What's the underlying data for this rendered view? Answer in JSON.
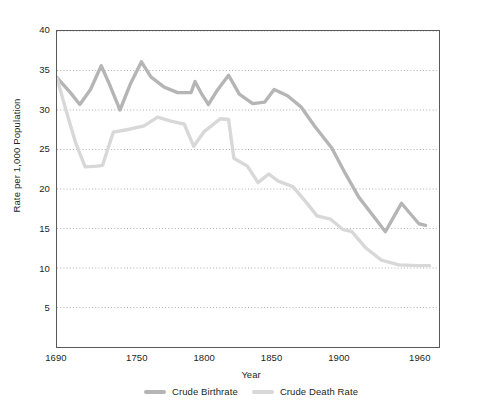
{
  "chart_data": {
    "type": "line",
    "title": "",
    "xlabel": "Year",
    "ylabel": "Rate per 1,000 Population",
    "xlim": [
      1690,
      1975
    ],
    "ylim": [
      0,
      40
    ],
    "yticks": [
      5,
      10,
      15,
      20,
      25,
      30,
      35,
      40
    ],
    "xticks": [
      1690,
      1750,
      1800,
      1850,
      1900,
      1960
    ],
    "grid": "horizontal-dotted",
    "legend_position": "bottom-center",
    "series": [
      {
        "name": "Crude Birthrate",
        "color": "#b5b5b5",
        "points": [
          [
            1690,
            34.1
          ],
          [
            1700,
            32.2
          ],
          [
            1707,
            30.7
          ],
          [
            1715,
            32.6
          ],
          [
            1723,
            35.6
          ],
          [
            1729,
            33.3
          ],
          [
            1737,
            30.0
          ],
          [
            1745,
            33.4
          ],
          [
            1753,
            36.1
          ],
          [
            1760,
            34.2
          ],
          [
            1770,
            32.9
          ],
          [
            1780,
            32.2
          ],
          [
            1790,
            32.2
          ],
          [
            1793,
            33.6
          ],
          [
            1798,
            32.0
          ],
          [
            1803,
            30.7
          ],
          [
            1810,
            32.6
          ],
          [
            1818,
            34.4
          ],
          [
            1826,
            32.0
          ],
          [
            1836,
            30.8
          ],
          [
            1845,
            31.0
          ],
          [
            1852,
            32.6
          ],
          [
            1862,
            31.8
          ],
          [
            1872,
            30.4
          ],
          [
            1882,
            28.0
          ],
          [
            1895,
            25.2
          ],
          [
            1905,
            22.0
          ],
          [
            1915,
            19.0
          ],
          [
            1925,
            16.8
          ],
          [
            1935,
            14.6
          ],
          [
            1947,
            18.2
          ],
          [
            1960,
            15.6
          ],
          [
            1965,
            15.4
          ]
        ]
      },
      {
        "name": "Crude Death Rate",
        "color": "#d8d8d8",
        "points": [
          [
            1690,
            34.0
          ],
          [
            1697,
            29.8
          ],
          [
            1704,
            25.8
          ],
          [
            1711,
            22.8
          ],
          [
            1720,
            22.9
          ],
          [
            1724,
            23.0
          ],
          [
            1732,
            27.2
          ],
          [
            1742,
            27.5
          ],
          [
            1755,
            28.0
          ],
          [
            1765,
            29.1
          ],
          [
            1775,
            28.6
          ],
          [
            1785,
            28.2
          ],
          [
            1792,
            25.4
          ],
          [
            1800,
            27.3
          ],
          [
            1812,
            28.9
          ],
          [
            1818,
            28.8
          ],
          [
            1822,
            23.9
          ],
          [
            1832,
            22.9
          ],
          [
            1840,
            20.8
          ],
          [
            1848,
            21.9
          ],
          [
            1855,
            21.0
          ],
          [
            1866,
            20.3
          ],
          [
            1876,
            18.3
          ],
          [
            1884,
            16.6
          ],
          [
            1894,
            16.2
          ],
          [
            1903,
            14.9
          ],
          [
            1910,
            14.6
          ],
          [
            1920,
            12.6
          ],
          [
            1932,
            11.0
          ],
          [
            1945,
            10.4
          ],
          [
            1960,
            10.3
          ],
          [
            1968,
            10.3
          ]
        ]
      }
    ]
  },
  "axes": {
    "ylabel": "Rate per 1,000 Population",
    "xlabel": "Year",
    "ytick_labels": [
      "40",
      "35",
      "30",
      "25",
      "20",
      "15",
      "10",
      "5"
    ],
    "xtick_labels": [
      "1690",
      "1750",
      "1800",
      "1850",
      "1900",
      "1960"
    ]
  },
  "legend": {
    "items": [
      {
        "label": "Crude Birthrate",
        "color": "#b5b5b5"
      },
      {
        "label": "Crude Death Rate",
        "color": "#d8d8d8"
      }
    ]
  }
}
